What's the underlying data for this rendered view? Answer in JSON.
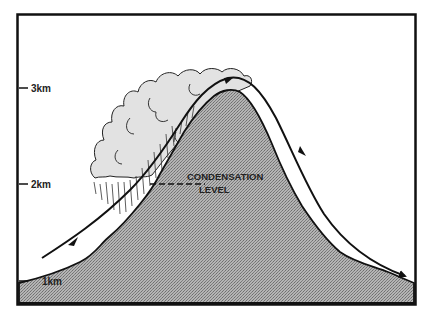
{
  "diagram": {
    "type": "orographic-lift cross-section",
    "altitude_labels": [
      {
        "text": "3km",
        "y": 88
      },
      {
        "text": "2km",
        "y": 184
      },
      {
        "text": "1km",
        "y": 281
      }
    ],
    "annotation": {
      "line1": "CONDENSATION",
      "line2": "LEVEL"
    },
    "elements": {
      "mountain": "mountain-silhouette (stippled grey)",
      "cloud": "orographic cloud on windward slope",
      "rain": "precipitation streaks below cloud",
      "airflow": "air-flow arrow rising over mountain and descending on lee side"
    },
    "colors": {
      "frame": "#111111",
      "mountain_fill": "#a9a9a9",
      "cloud_fill": "#e2e2e2",
      "line": "#111111",
      "background": "#ffffff"
    }
  }
}
